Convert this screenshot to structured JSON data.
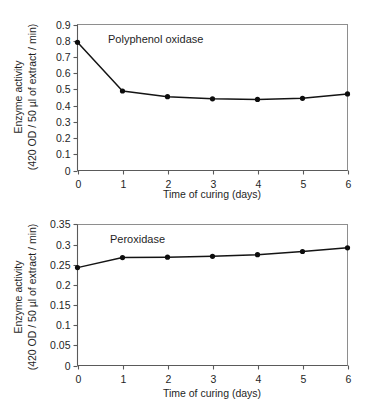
{
  "figure": {
    "panels": [
      {
        "name": "polyphenol-oxidase-panel",
        "series_label": "Polyphenol oxidase",
        "xlabel": "Time of curing (days)",
        "ylabel_line1": "Enzyme activity",
        "ylabel_line2": "(420 OD / 50 µl of extract / min)",
        "yticks": [
          "0",
          "0.1",
          "0.2",
          "0.3",
          "0.4",
          "0.5",
          "0.6",
          "0.7",
          "0.8",
          "0.9"
        ],
        "xticks": [
          "0",
          "1",
          "2",
          "3",
          "4",
          "5",
          "6"
        ]
      },
      {
        "name": "peroxidase-panel",
        "series_label": "Peroxidase",
        "xlabel": "Time of curing (days)",
        "ylabel_line1": "Enzyme activity",
        "ylabel_line2": "(420 OD / 50 µl of extract / min)",
        "yticks": [
          "0",
          "0.05",
          "0.1",
          "0.15",
          "0.2",
          "0.25",
          "0.3",
          "0.35"
        ],
        "xticks": [
          "0",
          "1",
          "2",
          "3",
          "4",
          "5",
          "6"
        ]
      }
    ]
  },
  "chart_data": [
    {
      "type": "line",
      "title": "Polyphenol oxidase",
      "xlabel": "Time of curing (days)",
      "ylabel": "Enzyme activity (420 OD / 50 µl of extract / min)",
      "x": [
        0,
        1,
        2,
        3,
        4,
        5,
        6
      ],
      "values": [
        0.79,
        0.49,
        0.455,
        0.442,
        0.438,
        0.445,
        0.472
      ],
      "xlim": [
        0,
        6
      ],
      "ylim": [
        0,
        0.9
      ],
      "ytick_step": 0.1,
      "xtick_step": 1,
      "grid": false,
      "legend": "none",
      "marker": "filled-circle",
      "line_color": "#141414"
    },
    {
      "type": "line",
      "title": "Peroxidase",
      "xlabel": "Time of curing (days)",
      "ylabel": "Enzyme activity (420 OD / 50 µl of extract / min)",
      "x": [
        0,
        1,
        2,
        3,
        4,
        5,
        6
      ],
      "values": [
        0.243,
        0.268,
        0.269,
        0.271,
        0.275,
        0.283,
        0.292
      ],
      "xlim": [
        0,
        6
      ],
      "ylim": [
        0,
        0.35
      ],
      "ytick_step": 0.05,
      "xtick_step": 1,
      "grid": false,
      "legend": "none",
      "marker": "filled-circle",
      "line_color": "#141414"
    }
  ]
}
